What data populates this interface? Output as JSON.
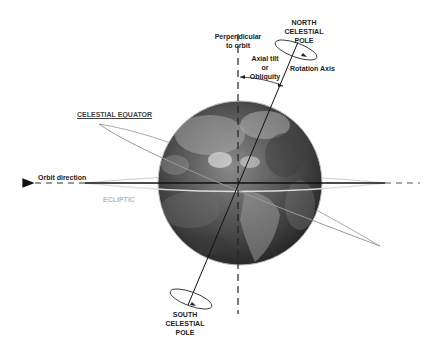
{
  "labels": {
    "north_pole": [
      "NORTH",
      "CELESTIAL",
      "POLE"
    ],
    "south_pole": [
      "SOUTH",
      "CELESTIAL",
      "POLE"
    ],
    "perpendicular": [
      "Perpendicular",
      "to orbit"
    ],
    "axial_tilt": [
      "Axial tilt",
      "or",
      "Obliquity"
    ],
    "rotation_axis": "Rotation Axis",
    "celestial_equator": "CELESTIAL EQUATOR",
    "orbit_direction": "Orbit direction",
    "ecliptic": "ECLIPTIC"
  },
  "colors": {
    "ink": "#222222",
    "ecliptic_ring": "#cccccc",
    "equator_ring": "#999999",
    "earth_dark": "#2e2e2e",
    "earth_light": "#8a8a8a"
  }
}
